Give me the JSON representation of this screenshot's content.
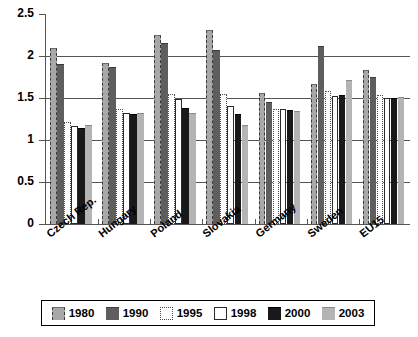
{
  "chart_data": {
    "type": "bar",
    "title": "",
    "xlabel": "",
    "ylabel": "",
    "ylim": [
      0,
      2.5
    ],
    "ytick_labels": [
      "2.5",
      "2",
      "1.5",
      "1",
      "0.5",
      "0"
    ],
    "ytick_values": [
      2.5,
      2,
      1.5,
      1,
      0.5,
      0
    ],
    "grid": true,
    "legend_position": "bottom",
    "categories": [
      "Czech Rep.",
      "Hungary",
      "Poland",
      "Slovakia",
      "Germany",
      "Sweden",
      "EU15"
    ],
    "series": [
      {
        "name": "1980",
        "color": "#a8a8a8",
        "values": [
          2.1,
          1.92,
          2.25,
          2.31,
          1.56,
          1.67,
          1.83
        ]
      },
      {
        "name": "1990",
        "color": "#5e5e5e",
        "values": [
          1.9,
          1.87,
          2.15,
          2.07,
          1.45,
          2.12,
          1.75
        ]
      },
      {
        "name": "1995",
        "color": "#ffffff",
        "values": [
          1.21,
          1.37,
          1.55,
          1.55,
          1.37,
          1.58,
          1.53
        ]
      },
      {
        "name": "1998",
        "color": "#ffffff",
        "values": [
          1.17,
          1.32,
          1.49,
          1.41,
          1.37,
          1.52,
          1.5
        ]
      },
      {
        "name": "2000",
        "color": "#191919",
        "values": [
          1.14,
          1.31,
          1.38,
          1.31,
          1.36,
          1.53,
          1.5
        ]
      },
      {
        "name": "2003",
        "color": "#b4b4b4",
        "values": [
          1.18,
          1.32,
          1.32,
          1.18,
          1.34,
          1.72,
          1.51
        ]
      }
    ]
  },
  "legend": {
    "items": [
      {
        "label": "1980",
        "swatch": "swatch-1980"
      },
      {
        "label": "1990",
        "swatch": "swatch-1990"
      },
      {
        "label": "1995",
        "swatch": "swatch-1995"
      },
      {
        "label": "1998",
        "swatch": "swatch-1998"
      },
      {
        "label": "2000",
        "swatch": "swatch-2000"
      },
      {
        "label": "2003",
        "swatch": "swatch-2003"
      }
    ]
  }
}
